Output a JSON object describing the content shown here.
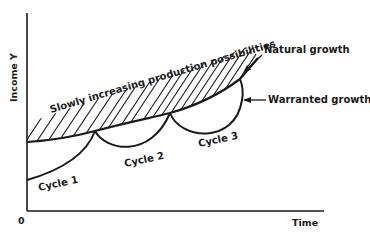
{
  "diagram": {
    "title": "",
    "y_axis_label": "Income Y",
    "x_axis_label": "Time",
    "origin_label": "0",
    "shaded_region_label": "Slowly increasing production possibilities",
    "curves": [
      {
        "id": "natural",
        "label": "Natural growth"
      },
      {
        "id": "warranted",
        "label": "Warranted growth"
      }
    ],
    "cycles": [
      {
        "label": "Cycle 1"
      },
      {
        "label": "Cycle 2"
      },
      {
        "label": "Cycle 3"
      }
    ],
    "colors": {
      "ink": "#1a1a1a",
      "background": "#ffffff"
    }
  }
}
